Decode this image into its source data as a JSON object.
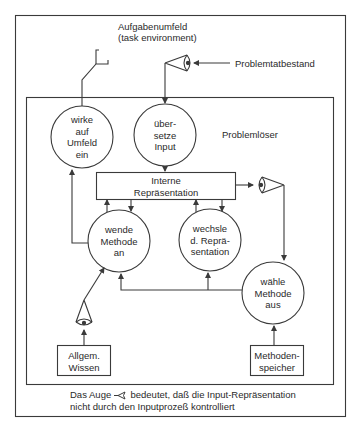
{
  "diagram": {
    "environment": {
      "title_line1": "Aufgabenumfeld",
      "title_line2": "(task environment)",
      "problem_input_label": "Problemtatbestand"
    },
    "solver": {
      "label": "Problemlöser",
      "nodes": {
        "act": {
          "lines": [
            "wirke",
            "auf",
            "Umfeld",
            "ein"
          ]
        },
        "translate": {
          "lines": [
            "über-",
            "setze",
            "Input"
          ]
        },
        "internal_rep": {
          "lines": [
            "Interne",
            "Repräsentation"
          ]
        },
        "apply_method": {
          "lines": [
            "wende",
            "Methode",
            "an"
          ]
        },
        "change_rep": {
          "lines": [
            "wechsle",
            "d. Reprä-",
            "sentation"
          ]
        },
        "select_method": {
          "lines": [
            "wähle",
            "Methode",
            "aus"
          ]
        },
        "general_knowledge": {
          "lines": [
            "Allgem.",
            "Wissen"
          ]
        },
        "method_store": {
          "lines": [
            "Methoden-",
            "speicher"
          ]
        }
      }
    },
    "caption": {
      "line1_before_symbol": "Das Auge",
      "symbol": "eye-symbol",
      "line1_after_symbol": "bedeutet, daß die Input-Repräsentation",
      "line2": "nicht durch den Inputprozeß kontrolliert"
    },
    "colors": {
      "line": "#3a3a3a",
      "background": "#ffffff"
    }
  }
}
